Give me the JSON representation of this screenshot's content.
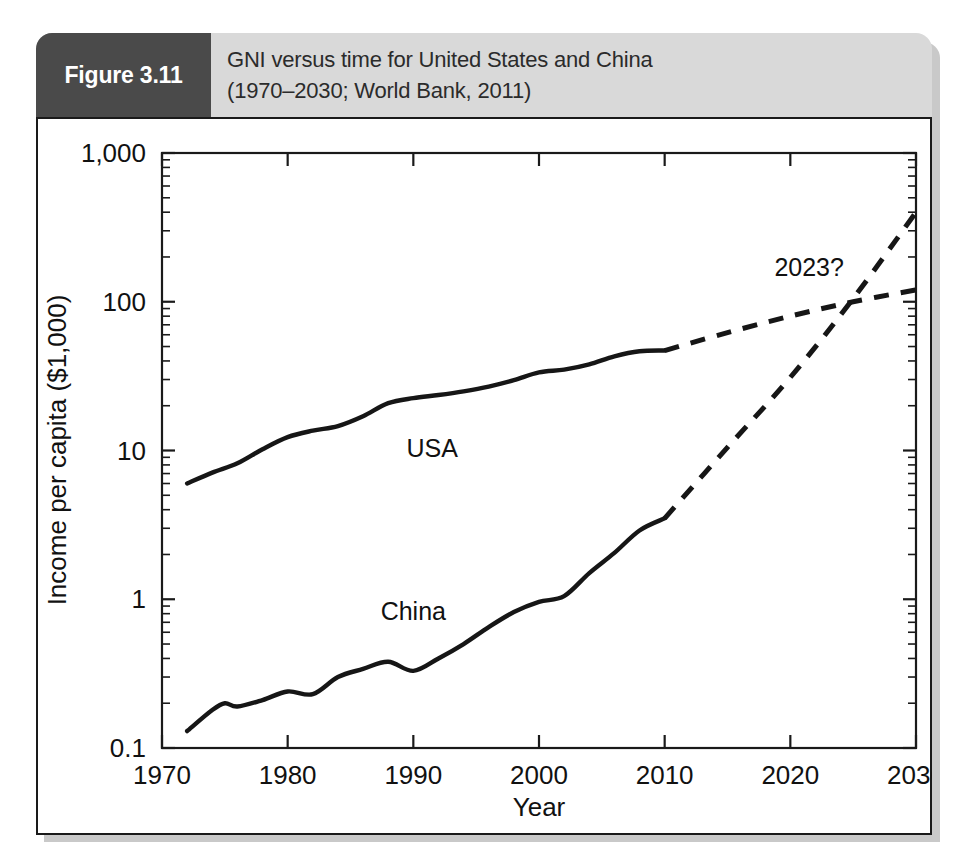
{
  "figure": {
    "tag": "Figure 3.11",
    "caption_line1": "GNI versus time for United States and China",
    "caption_line2": "(1970–2030; World Bank, 2011)",
    "tag_bg_color": "#4a4a4a",
    "caption_bg_color": "#d9d9d9",
    "ink_color": "#161616"
  },
  "chart_data": {
    "type": "line",
    "title": "GNI versus time for United States and China (1970–2030; World Bank, 2011)",
    "xlabel": "Year",
    "ylabel": "Income per capita ($1,000)",
    "xlim": [
      1970,
      2030
    ],
    "ylim": [
      0.1,
      1000
    ],
    "yscale": "log",
    "xscale": "linear",
    "grid": false,
    "legend": "inline-labels",
    "xticks": [
      "1970",
      "1980",
      "1990",
      "2000",
      "2010",
      "2020",
      "2030"
    ],
    "xtick_values": [
      1970,
      1980,
      1990,
      2000,
      2010,
      2020,
      2030
    ],
    "yticks": [
      "0.1",
      "1",
      "10",
      "100",
      "1,000"
    ],
    "ytick_values": [
      0.1,
      1,
      10,
      100,
      1000
    ],
    "annotations": [
      {
        "text": "2023?",
        "x": 2021.5,
        "y": 150,
        "note": "crossover of USA and China projections"
      },
      {
        "text": "USA",
        "x": 1991.5,
        "y": 9.0,
        "note": "inline series label"
      },
      {
        "text": "China",
        "x": 1990.0,
        "y": 0.72,
        "note": "inline series label"
      }
    ],
    "series": [
      {
        "name": "USA",
        "style": "solid-then-dashed",
        "solid_x": [
          1972,
          1974,
          1976,
          1978,
          1980,
          1982,
          1984,
          1986,
          1988,
          1990,
          1992,
          1994,
          1996,
          1998,
          2000,
          2002,
          2004,
          2006,
          2008,
          2010
        ],
        "solid_y": [
          6.0,
          7.1,
          8.2,
          10.2,
          12.3,
          13.6,
          14.6,
          17.0,
          20.8,
          22.5,
          23.6,
          25.0,
          26.9,
          29.7,
          33.5,
          35.0,
          38.0,
          43.0,
          46.5,
          47.0
        ],
        "dashed_x": [
          2010,
          2015,
          2020,
          2025,
          2030
        ],
        "dashed_y": [
          47.0,
          62.0,
          80.0,
          100.0,
          120.0
        ]
      },
      {
        "name": "China",
        "style": "solid-then-dashed",
        "solid_x": [
          1972,
          1974,
          1975,
          1976,
          1978,
          1980,
          1982,
          1984,
          1986,
          1988,
          1990,
          1992,
          1994,
          1996,
          1998,
          2000,
          2002,
          2004,
          2006,
          2008,
          2010
        ],
        "solid_y": [
          0.13,
          0.18,
          0.2,
          0.19,
          0.21,
          0.24,
          0.23,
          0.3,
          0.34,
          0.38,
          0.33,
          0.4,
          0.5,
          0.65,
          0.82,
          0.96,
          1.05,
          1.5,
          2.05,
          2.9,
          3.5
        ],
        "dashed_x": [
          2010,
          2015,
          2020,
          2025,
          2030
        ],
        "dashed_y": [
          3.5,
          10.5,
          31.0,
          105.0,
          400.0
        ]
      }
    ]
  }
}
